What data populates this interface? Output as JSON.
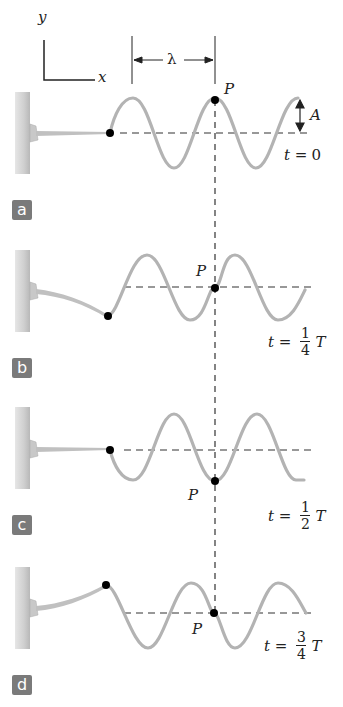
{
  "axes": {
    "x_label": "x",
    "y_label": "y"
  },
  "wavelength_label": "λ",
  "amplitude_label": "A",
  "point_label": "P",
  "colors": {
    "wave": "#b3b3b3",
    "wall": "#cfcfcf",
    "dashed": "#333333",
    "dot": "#000000",
    "badge_bg": "#7a7a7a",
    "badge_text": "#ffffff"
  },
  "panels": [
    {
      "id": "a",
      "badge": "a",
      "time_prefix": "t =",
      "time_value": "0",
      "time_num": "",
      "time_den": "",
      "time_suffix": ""
    },
    {
      "id": "b",
      "badge": "b",
      "time_prefix": "t =",
      "time_value": "",
      "time_num": "1",
      "time_den": "4",
      "time_suffix": "T"
    },
    {
      "id": "c",
      "badge": "c",
      "time_prefix": "t =",
      "time_value": "",
      "time_num": "1",
      "time_den": "2",
      "time_suffix": "T"
    },
    {
      "id": "d",
      "badge": "d",
      "time_prefix": "t =",
      "time_value": "",
      "time_num": "3",
      "time_den": "4",
      "time_suffix": "T"
    }
  ]
}
